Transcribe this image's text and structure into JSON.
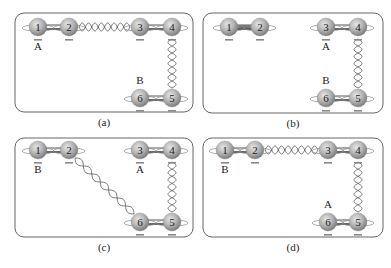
{
  "figure": {
    "panels": [
      {
        "id": "a",
        "caption": "(a)",
        "box": {
          "x": 15,
          "y": 13,
          "w": 178,
          "h": 99
        },
        "nodes": [
          {
            "num": "1",
            "x": 38,
            "y": 27
          },
          {
            "num": "2",
            "x": 69,
            "y": 27
          },
          {
            "num": "3",
            "x": 140,
            "y": 27
          },
          {
            "num": "4",
            "x": 172,
            "y": 27
          },
          {
            "num": "6",
            "x": 140,
            "y": 98
          },
          {
            "num": "5",
            "x": 172,
            "y": 98
          }
        ],
        "labels": [
          {
            "text": "A",
            "x": 38,
            "y": 50
          },
          {
            "text": "B",
            "x": 140,
            "y": 84
          }
        ],
        "links": [
          {
            "from": "2",
            "to": "3",
            "type": "entangled"
          },
          {
            "from": "4",
            "to": "5",
            "type": "entangled"
          }
        ]
      },
      {
        "id": "b",
        "caption": "(b)",
        "box": {
          "x": 203,
          "y": 13,
          "w": 180,
          "h": 100
        },
        "nodes": [
          {
            "num": "1",
            "x": 229,
            "y": 27
          },
          {
            "num": "2",
            "x": 260,
            "y": 27
          },
          {
            "num": "3",
            "x": 326,
            "y": 27
          },
          {
            "num": "4",
            "x": 358,
            "y": 27
          },
          {
            "num": "6",
            "x": 326,
            "y": 98
          },
          {
            "num": "5",
            "x": 358,
            "y": 98
          }
        ],
        "labels": [
          {
            "text": "A",
            "x": 326,
            "y": 50
          },
          {
            "text": "B",
            "x": 326,
            "y": 84
          }
        ],
        "links": [
          {
            "from": "1",
            "to": "2",
            "type": "local-coil"
          },
          {
            "from": "4",
            "to": "5",
            "type": "entangled"
          }
        ]
      },
      {
        "id": "c",
        "caption": "(c)",
        "box": {
          "x": 15,
          "y": 138,
          "w": 178,
          "h": 99
        },
        "nodes": [
          {
            "num": "1",
            "x": 38,
            "y": 150
          },
          {
            "num": "2",
            "x": 69,
            "y": 150
          },
          {
            "num": "3",
            "x": 140,
            "y": 150
          },
          {
            "num": "4",
            "x": 172,
            "y": 150
          },
          {
            "num": "6",
            "x": 140,
            "y": 222
          },
          {
            "num": "5",
            "x": 172,
            "y": 222
          }
        ],
        "labels": [
          {
            "text": "B",
            "x": 38,
            "y": 173
          },
          {
            "text": "A",
            "x": 140,
            "y": 173
          }
        ],
        "links": [
          {
            "from": "2",
            "to": "6",
            "type": "entangled-diagonal"
          },
          {
            "from": "4",
            "to": "5",
            "type": "entangled"
          }
        ]
      },
      {
        "id": "d",
        "caption": "(d)",
        "box": {
          "x": 203,
          "y": 138,
          "w": 180,
          "h": 99
        },
        "nodes": [
          {
            "num": "1",
            "x": 225,
            "y": 150
          },
          {
            "num": "2",
            "x": 255,
            "y": 150
          },
          {
            "num": "3",
            "x": 328,
            "y": 150
          },
          {
            "num": "4",
            "x": 358,
            "y": 150
          },
          {
            "num": "6",
            "x": 328,
            "y": 222
          },
          {
            "num": "5",
            "x": 358,
            "y": 222
          }
        ],
        "labels": [
          {
            "text": "B",
            "x": 225,
            "y": 173
          },
          {
            "text": "A",
            "x": 328,
            "y": 208
          }
        ],
        "links": [
          {
            "from": "2",
            "to": "3",
            "type": "entangled"
          },
          {
            "from": "4",
            "to": "5",
            "type": "entangled"
          }
        ]
      }
    ],
    "colors": {
      "box_stroke": "#555555",
      "sphere_fill": "#b8b8b8",
      "sphere_dark": "#7a7a7a",
      "wire": "#555555",
      "bar": "#444444"
    }
  }
}
